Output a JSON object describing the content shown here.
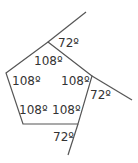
{
  "diagram": {
    "type": "regular-pentagon-exterior-angles",
    "stroke_color": "#555555",
    "text_color": "#333333",
    "vertices": [
      {
        "name": "top",
        "x": 48,
        "y": 42
      },
      {
        "name": "right",
        "x": 92,
        "y": 76
      },
      {
        "name": "bottom-right",
        "x": 78,
        "y": 124
      },
      {
        "name": "bottom-left",
        "x": 23,
        "y": 124
      },
      {
        "name": "left",
        "x": 6,
        "y": 73
      }
    ],
    "extensions": [
      {
        "from": "top",
        "x2": 86,
        "y2": 12
      },
      {
        "from": "right",
        "x2": 132,
        "y2": 100
      },
      {
        "from": "bottom-right",
        "x2": 68,
        "y2": 155
      }
    ],
    "labels": {
      "ext_top": "72º",
      "ext_right": "72º",
      "ext_bottom": "72º",
      "int_top": "108º",
      "int_left": "108º",
      "int_right": "108º",
      "int_bottom_left": "108º",
      "int_bottom_right": "108º"
    }
  }
}
